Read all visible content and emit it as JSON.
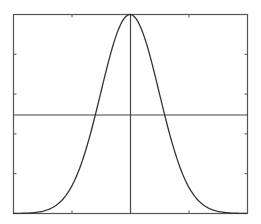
{
  "chart_data": {
    "type": "line",
    "title": "",
    "xlabel": "",
    "ylabel": "",
    "xlim": [
      -4,
      4
    ],
    "ylim": [
      0,
      1
    ],
    "grid": false,
    "legend": null,
    "x_ticks": [
      -2,
      0,
      2
    ],
    "y_ticks": [
      0.2,
      0.4,
      0.6,
      0.8
    ],
    "tick_labels_visible": false,
    "reference_lines": {
      "horizontal": 0.5,
      "vertical": 0
    },
    "series": [
      {
        "name": "gaussian",
        "function": "exp(-x^2/2)",
        "x": [
          -4,
          -3.5,
          -3,
          -2.5,
          -2,
          -1.5,
          -1,
          -0.5,
          0,
          0.5,
          1,
          1.5,
          2,
          2.5,
          3,
          3.5,
          4
        ],
        "y": [
          0.0003,
          0.0022,
          0.0111,
          0.0439,
          0.1353,
          0.3247,
          0.6065,
          0.8825,
          1.0,
          0.8825,
          0.6065,
          0.3247,
          0.1353,
          0.0439,
          0.0111,
          0.0022,
          0.0003
        ]
      }
    ]
  },
  "colors": {
    "frame": "#555555",
    "curve": "#333333",
    "reference": "#444444",
    "background": "#ffffff"
  }
}
